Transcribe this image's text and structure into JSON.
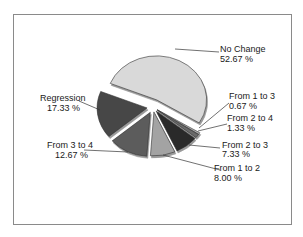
{
  "chart_data": {
    "type": "pie",
    "title": "",
    "exploded": true,
    "three_d": true,
    "legend": "none (callout labels)",
    "slices": [
      {
        "label": "No Change",
        "value": 52.67,
        "display": "52.67 %",
        "color": "#d9d9d9"
      },
      {
        "label": "From 1 to 3",
        "value": 0.67,
        "display": "0.67 %",
        "color": "#b0b0b0"
      },
      {
        "label": "From 2 to 4",
        "value": 1.33,
        "display": "1.33 %",
        "color": "#6a6a6a"
      },
      {
        "label": "From 2 to 3",
        "value": 7.33,
        "display": "7.33 %",
        "color": "#2b2b2b"
      },
      {
        "label": "From 1 to 2",
        "value": 8.0,
        "display": "8.00 %",
        "color": "#a3a3a3"
      },
      {
        "label": "From 3 to 4",
        "value": 12.67,
        "display": "12.67 %",
        "color": "#5c5c5c"
      },
      {
        "label": "Regression",
        "value": 17.33,
        "display": "17.33 %",
        "color": "#474747"
      }
    ]
  },
  "labels": {
    "no_change": {
      "name": "No Change",
      "pct": "52.67 %"
    },
    "from_1_to_3": {
      "name": "From 1 to 3",
      "pct": "0.67 %"
    },
    "from_2_to_4": {
      "name": "From 2 to 4",
      "pct": "1.33 %"
    },
    "from_2_to_3": {
      "name": "From 2 to 3",
      "pct": "7.33 %"
    },
    "from_1_to_2": {
      "name": "From 1 to 2",
      "pct": "8.00 %"
    },
    "from_3_to_4": {
      "name": "From 3 to 4",
      "pct": "12.67 %"
    },
    "regression": {
      "name": "Regression",
      "pct": "17.33 %"
    }
  }
}
